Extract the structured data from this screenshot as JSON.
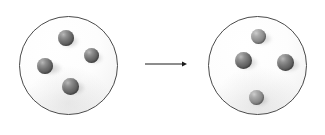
{
  "figure": {
    "type": "particle-state-diagram",
    "title": "",
    "background_color": "#ffffff",
    "width": 325,
    "height": 135
  },
  "colors": {
    "background": "#ffffff",
    "circle_outline": "#4a4a4a",
    "circle_fill": "#fdfdfd",
    "sphere_dark": "#5a5a5a",
    "sphere_light": "#919191",
    "sphere_highlight": "#b9b9b9",
    "arrow": "#1a1a1a",
    "shadow": "#9a9a9a"
  },
  "containers": [
    {
      "id": "left-container",
      "label": "",
      "cx": 68,
      "cy": 65,
      "diameter": 99,
      "particle_count": 4,
      "particles": [
        {
          "id": "left-particle-1",
          "label": "",
          "cx": 66,
          "cy": 38,
          "d": 16,
          "tone": "dark",
          "shadow_dx": 3,
          "shadow_dy": 3,
          "shadow_w": 19,
          "shadow_h": 13
        },
        {
          "id": "left-particle-2",
          "label": "",
          "cx": 91,
          "cy": 55,
          "d": 15,
          "tone": "dark",
          "shadow_dx": 3,
          "shadow_dy": 3,
          "shadow_w": 18,
          "shadow_h": 12
        },
        {
          "id": "left-particle-3",
          "label": "",
          "cx": 45,
          "cy": 66,
          "d": 16,
          "tone": "dark",
          "shadow_dx": 5,
          "shadow_dy": 2,
          "shadow_w": 24,
          "shadow_h": 13
        },
        {
          "id": "left-particle-4",
          "label": "",
          "cx": 70,
          "cy": 86,
          "d": 17,
          "tone": "dark",
          "shadow_dx": 4,
          "shadow_dy": 2,
          "shadow_w": 22,
          "shadow_h": 14
        }
      ]
    },
    {
      "id": "right-container",
      "label": "",
      "cx": 257,
      "cy": 65,
      "diameter": 99,
      "particle_count": 4,
      "particles": [
        {
          "id": "right-particle-1",
          "label": "",
          "cx": 258,
          "cy": 36,
          "d": 15,
          "tone": "light",
          "shadow_dx": 4,
          "shadow_dy": 3,
          "shadow_w": 19,
          "shadow_h": 12
        },
        {
          "id": "right-particle-2",
          "label": "",
          "cx": 243,
          "cy": 60,
          "d": 17,
          "tone": "dark",
          "shadow_dx": 4,
          "shadow_dy": 3,
          "shadow_w": 22,
          "shadow_h": 14
        },
        {
          "id": "right-particle-3",
          "label": "",
          "cx": 285,
          "cy": 62,
          "d": 17,
          "tone": "dark",
          "shadow_dx": 4,
          "shadow_dy": 3,
          "shadow_w": 22,
          "shadow_h": 14
        },
        {
          "id": "right-particle-4",
          "label": "",
          "cx": 256,
          "cy": 97,
          "d": 15,
          "tone": "light",
          "shadow_dx": 3,
          "shadow_dy": 3,
          "shadow_w": 19,
          "shadow_h": 12
        }
      ]
    }
  ],
  "arrow": {
    "id": "transition-arrow",
    "label": "",
    "direction": "right",
    "x_start": 145,
    "x_end": 186,
    "y": 64,
    "stroke_width": 1,
    "head_size": 5
  }
}
